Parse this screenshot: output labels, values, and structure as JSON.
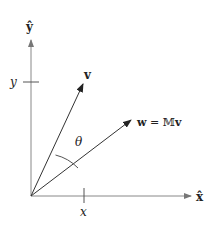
{
  "diagram": {
    "title": "",
    "axes": {
      "x_label": "x̂",
      "y_label": "ŷ",
      "axis_color": "#777777"
    },
    "ticks": {
      "x_tick_label": "x",
      "y_tick_label": "y"
    },
    "vectors": [
      {
        "name": "v",
        "label": "v",
        "color": "#222222"
      },
      {
        "name": "w",
        "label_lhs": "w",
        "label_eq": " = ",
        "label_rhs_M": "𝕄",
        "label_rhs_v": "v",
        "color": "#222222"
      }
    ],
    "angle": {
      "label": "θ"
    }
  }
}
